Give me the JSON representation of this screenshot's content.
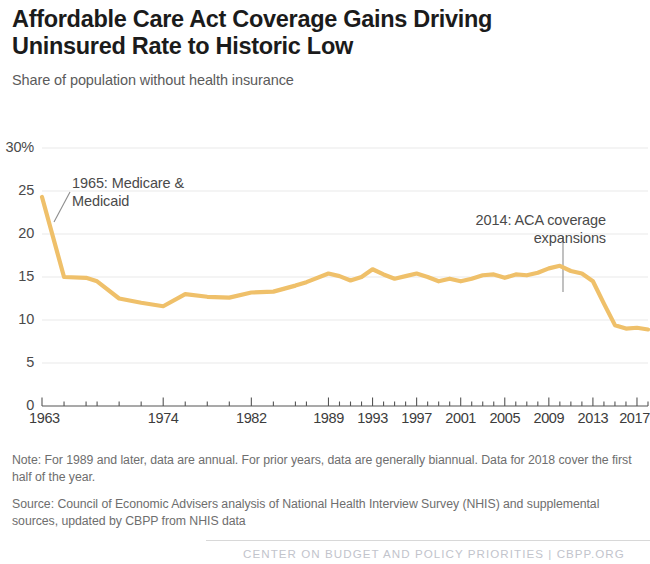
{
  "header": {
    "title": "Affordable Care Act Coverage Gains Driving\nUninsured Rate to Historic Low",
    "subtitle": "Share of population without health insurance"
  },
  "footnotes": {
    "note": "Note: For 1989 and later, data are annual. For prior years, data are generally biannual. Data for 2018 cover the first half of the year.",
    "source": "Source: Council of Economic Advisers analysis of National Health Interview Survey (NHIS) and supplemental sources, updated by CBPP from NHIS data"
  },
  "footer": {
    "credit": "CENTER ON BUDGET AND POLICY PRIORITIES | CBPP.ORG"
  },
  "chart_data": {
    "type": "line",
    "title": "Affordable Care Act Coverage Gains Driving Uninsured Rate to Historic Low",
    "subtitle": "Share of population without health insurance",
    "xlabel": "",
    "ylabel": "Share of population without health insurance",
    "xlim": [
      1963,
      2018
    ],
    "ylim": [
      0,
      30
    ],
    "grid": true,
    "legend": false,
    "line_color": "#EFC06A",
    "line_width": 4,
    "y_ticks": [
      0,
      5,
      10,
      15,
      20,
      25,
      30
    ],
    "y_tick_labels": [
      "0",
      "5",
      "10",
      "15",
      "20",
      "25",
      "30%"
    ],
    "x_tick_labels": [
      "1963",
      "1974",
      "1982",
      "1989",
      "1993",
      "1997",
      "2001",
      "2005",
      "2009",
      "2013",
      "2017"
    ],
    "x_tick_values": [
      1963,
      1974,
      1982,
      1989,
      1993,
      1997,
      2001,
      2005,
      2009,
      2013,
      2017
    ],
    "x_minor_ticks": [
      1965,
      1967,
      1968,
      1970,
      1972,
      1976,
      1978,
      1980,
      1984,
      1986,
      1987,
      1990,
      1991,
      1992,
      1994,
      1995,
      1996,
      1998,
      1999,
      2000,
      2002,
      2003,
      2004,
      2006,
      2007,
      2008,
      2010,
      2011,
      2012,
      2014,
      2015,
      2016,
      2018
    ],
    "series": [
      {
        "name": "Uninsured rate",
        "x": [
          1963,
          1965,
          1967,
          1968,
          1970,
          1972,
          1974,
          1976,
          1978,
          1980,
          1982,
          1984,
          1986,
          1987,
          1989,
          1990,
          1991,
          1992,
          1993,
          1994,
          1995,
          1996,
          1997,
          1998,
          1999,
          2000,
          2001,
          2002,
          2003,
          2004,
          2005,
          2006,
          2007,
          2008,
          2009,
          2010,
          2011,
          2012,
          2013,
          2014,
          2015,
          2016,
          2017,
          2018
        ],
        "values": [
          24.3,
          15.0,
          14.9,
          14.5,
          12.5,
          12.0,
          11.6,
          13.0,
          12.7,
          12.6,
          13.2,
          13.3,
          14.0,
          14.4,
          15.4,
          15.1,
          14.6,
          15.0,
          15.9,
          15.3,
          14.8,
          15.1,
          15.4,
          15.0,
          14.5,
          14.8,
          14.5,
          14.8,
          15.2,
          15.3,
          14.9,
          15.3,
          15.2,
          15.5,
          16.0,
          16.3,
          15.7,
          15.4,
          14.5,
          11.9,
          9.4,
          9.0,
          9.1,
          8.9
        ]
      }
    ],
    "annotations": [
      {
        "id": "medicare",
        "label": "1965: Medicare &\nMedicaid",
        "align": "left",
        "leader": "diagonal"
      },
      {
        "id": "aca",
        "label": "2014: ACA coverage\nexpansions",
        "align": "right",
        "leader": "vertical"
      }
    ]
  }
}
